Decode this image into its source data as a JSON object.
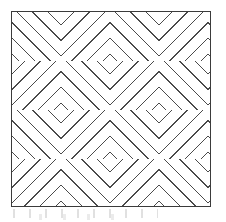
{
  "figure": {
    "kind": "dotted-basketweave-hatch-pattern",
    "canvas_width": 226,
    "canvas_height": 222,
    "background_color": "#ffffff",
    "caption": "",
    "title": ""
  },
  "frame": {
    "name": "plate-border",
    "left": 11,
    "top": 11,
    "width": 200,
    "height": 196,
    "border_width": 1,
    "border_color": "#3b3b3b",
    "fill_color": "#ffffff"
  },
  "pattern": {
    "description": "Square blocks alternating between +45 and -45 degree dotted diagonal rulings, forming a basketweave / herringbone texture",
    "block_size": 49,
    "columns": 5,
    "rows": 5,
    "dot_color": "#4a4a4a",
    "dot_size_px": 1,
    "dot_spacing_px": 3.1,
    "line_spacing_px": 5.5,
    "directions": [
      "up",
      "down"
    ],
    "grid": [
      [
        "up",
        "down",
        "up",
        "down",
        "up"
      ],
      [
        "down",
        "up",
        "down",
        "up",
        "down"
      ],
      [
        "up",
        "down",
        "up",
        "down",
        "up"
      ],
      [
        "down",
        "up",
        "down",
        "up",
        "down"
      ],
      [
        "up",
        "down",
        "up",
        "down",
        "up"
      ]
    ]
  },
  "artifacts": {
    "scan_smudge_label": "",
    "opacity": 0.3,
    "color": "#9a9a9a"
  }
}
